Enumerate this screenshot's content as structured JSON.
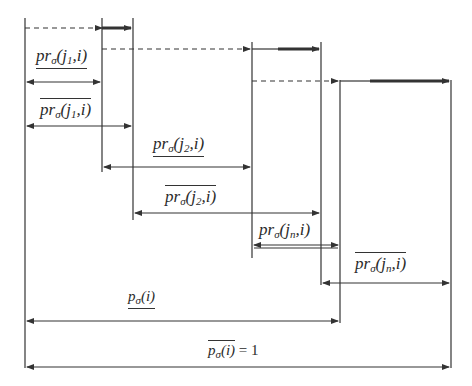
{
  "diagram": {
    "colors": {
      "line": "#333333",
      "background": "#ffffff"
    },
    "labels": [
      {
        "id": "pr-lower-j1",
        "base": "pr",
        "sigma": "σ",
        "args": "(j",
        "idx": "1",
        "rest": ",i)",
        "bar": "under"
      },
      {
        "id": "pr-upper-j1",
        "base": "pr",
        "sigma": "σ",
        "args": "(j",
        "idx": "1",
        "rest": ",i)",
        "bar": "over"
      },
      {
        "id": "pr-lower-j2",
        "base": "pr",
        "sigma": "σ",
        "args": "(j",
        "idx": "2",
        "rest": ",i)",
        "bar": "under"
      },
      {
        "id": "pr-upper-j2",
        "base": "pr",
        "sigma": "σ",
        "args": "(j",
        "idx": "2",
        "rest": ",i)",
        "bar": "over"
      },
      {
        "id": "pr-lower-jn",
        "base": "pr",
        "sigma": "σ",
        "args": "(j",
        "idx": "n",
        "rest": ",i)",
        "bar": "under"
      },
      {
        "id": "pr-upper-jn",
        "base": "pr",
        "sigma": "σ",
        "args": "(j",
        "idx": "n",
        "rest": ",i)",
        "bar": "over"
      },
      {
        "id": "p-lower",
        "base": "p",
        "sigma": "σ",
        "args": "(i)",
        "bar": "under"
      },
      {
        "id": "p-upper",
        "base": "p",
        "sigma": "σ",
        "args": "(i)",
        "rest": " = 1",
        "bar": "over"
      }
    ]
  }
}
